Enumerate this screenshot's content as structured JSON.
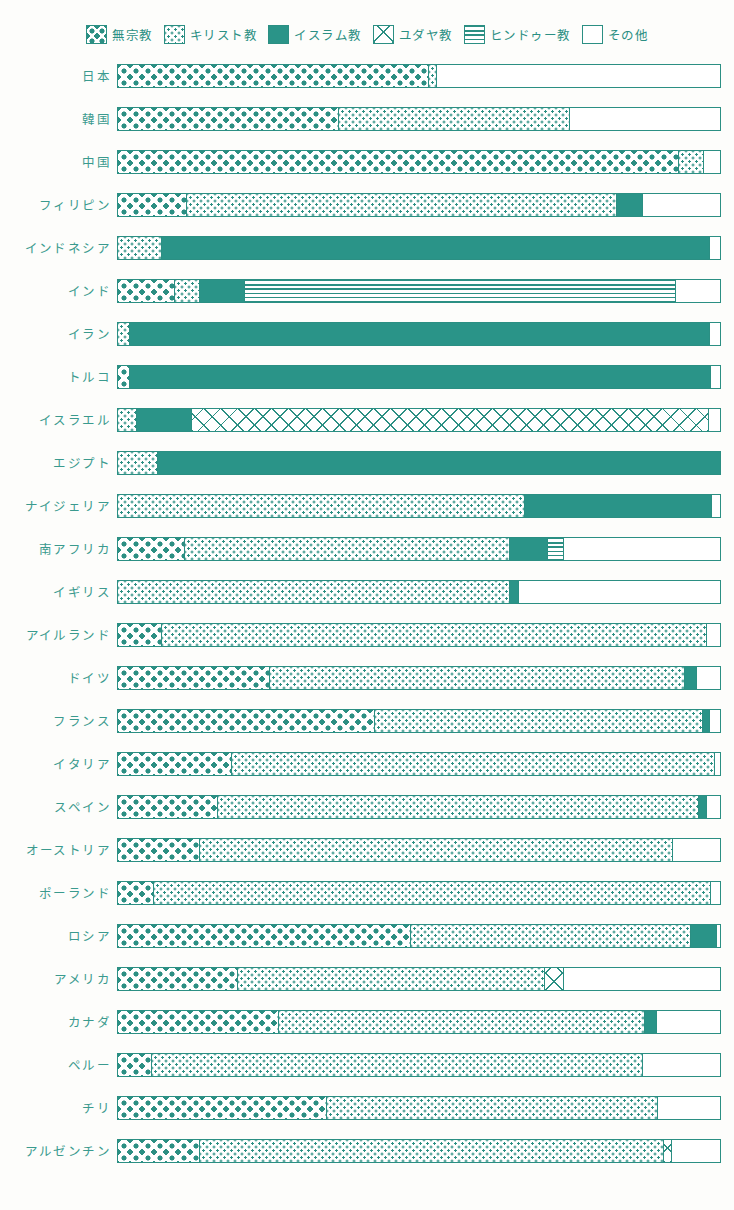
{
  "legend": {
    "items": [
      {
        "key": "none",
        "label": "無宗教",
        "pattern": "p-none",
        "icon": "diamond-grid-swatch"
      },
      {
        "key": "christian",
        "label": "キリスト教",
        "pattern": "p-christian",
        "icon": "dotted-swatch"
      },
      {
        "key": "islam",
        "label": "イスラム教",
        "pattern": "p-islam",
        "icon": "solid-teal-swatch"
      },
      {
        "key": "jewish",
        "label": "ユダヤ教",
        "pattern": "p-jewish",
        "icon": "cross-hatch-swatch"
      },
      {
        "key": "hindu",
        "label": "ヒンドゥー教",
        "pattern": "p-hindu",
        "icon": "horizontal-stripe-swatch"
      },
      {
        "key": "other",
        "label": "その他",
        "pattern": "p-other",
        "icon": "empty-swatch"
      }
    ]
  },
  "colors": {
    "teal": "#2a9488",
    "outline": "#2b8f83",
    "label": "#3a9a8e",
    "background": "#fdfdfb"
  },
  "footnote": "",
  "chart_data": {
    "type": "bar",
    "subtype": "stacked-horizontal-100percent",
    "title": "",
    "xlabel": "",
    "ylabel": "",
    "xlim": [
      0,
      100
    ],
    "grid": false,
    "legend_position": "top-center",
    "series": [
      {
        "name": "無宗教",
        "key": "none"
      },
      {
        "name": "キリスト教",
        "key": "christian"
      },
      {
        "name": "イスラム教",
        "key": "islam"
      },
      {
        "name": "ユダヤ教",
        "key": "jewish"
      },
      {
        "name": "ヒンドゥー教",
        "key": "hindu"
      },
      {
        "name": "その他",
        "key": "other"
      }
    ],
    "categories": [
      "日本",
      "韓国",
      "中国",
      "フィリピン",
      "インドネシア",
      "インド",
      "イラン",
      "トルコ",
      "イスラエル",
      "エジプト",
      "ナイジェリア",
      "南アフリカ",
      "イギリス",
      "アイルランド",
      "ドイツ",
      "フランス",
      "イタリア",
      "スペイン",
      "オーストリア",
      "ポーランド",
      "ロシア",
      "アメリカ",
      "カナダ",
      "ペルー",
      "チリ",
      "アルゼンチン"
    ],
    "rows": [
      {
        "country": "日本",
        "values": {
          "none": 51.5,
          "christian": 1.3,
          "islam": 0,
          "jewish": 0,
          "hindu": 0,
          "other": 47.2
        }
      },
      {
        "country": "韓国",
        "values": {
          "none": 36.5,
          "christian": 38.5,
          "islam": 0,
          "jewish": 0,
          "hindu": 0,
          "other": 25.0
        }
      },
      {
        "country": "中国",
        "values": {
          "none": 93.0,
          "christian": 4.2,
          "islam": 0,
          "jewish": 0,
          "hindu": 0,
          "other": 2.8
        }
      },
      {
        "country": "フィリピン",
        "values": {
          "none": 11.3,
          "christian": 71.4,
          "islam": 4.3,
          "jewish": 0,
          "hindu": 0,
          "other": 13.0
        }
      },
      {
        "country": "インドネシア",
        "values": {
          "none": 0,
          "christian": 7.2,
          "islam": 91.0,
          "jewish": 0,
          "hindu": 0,
          "other": 1.8
        }
      },
      {
        "country": "インド",
        "values": {
          "none": 9.3,
          "christian": 4.2,
          "islam": 7.5,
          "jewish": 0,
          "hindu": 71.5,
          "other": 7.5
        }
      },
      {
        "country": "イラン",
        "values": {
          "none": 0,
          "christian": 1.8,
          "islam": 96.4,
          "jewish": 0,
          "hindu": 0,
          "other": 1.8
        }
      },
      {
        "country": "トルコ",
        "values": {
          "none": 1.8,
          "christian": 0,
          "islam": 96.6,
          "jewish": 0,
          "hindu": 0,
          "other": 1.6
        }
      },
      {
        "country": "イスラエル",
        "values": {
          "none": 0,
          "christian": 3.0,
          "islam": 9.2,
          "jewish": 85.8,
          "hindu": 0,
          "other": 2.0
        }
      },
      {
        "country": "エジプト",
        "values": {
          "none": 0,
          "christian": 6.5,
          "islam": 93.5,
          "jewish": 0,
          "hindu": 0,
          "other": 0
        }
      },
      {
        "country": "ナイジェリア",
        "values": {
          "none": 0,
          "christian": 67.5,
          "islam": 31.0,
          "jewish": 0,
          "hindu": 0,
          "other": 1.5
        }
      },
      {
        "country": "南アフリカ",
        "values": {
          "none": 11.0,
          "christian": 54.0,
          "islam": 6.2,
          "jewish": 0,
          "hindu": 2.8,
          "other": 26.0
        }
      },
      {
        "country": "イギリス",
        "values": {
          "none": 0,
          "christian": 65.0,
          "islam": 1.5,
          "jewish": 0,
          "hindu": 0,
          "other": 33.5
        }
      },
      {
        "country": "アイルランド",
        "values": {
          "none": 7.2,
          "christian": 90.5,
          "islam": 0,
          "jewish": 0,
          "hindu": 0,
          "other": 2.3
        }
      },
      {
        "country": "ドイツ",
        "values": {
          "none": 25.0,
          "christian": 69.0,
          "islam": 2.0,
          "jewish": 0,
          "hindu": 0,
          "other": 4.0
        }
      },
      {
        "country": "フランス",
        "values": {
          "none": 42.5,
          "christian": 54.5,
          "islam": 1.2,
          "jewish": 0,
          "hindu": 0,
          "other": 1.8
        }
      },
      {
        "country": "イタリア",
        "values": {
          "none": 18.8,
          "christian": 80.2,
          "islam": 0,
          "jewish": 0,
          "hindu": 0,
          "other": 1.0
        }
      },
      {
        "country": "スペイン",
        "values": {
          "none": 16.5,
          "christian": 79.8,
          "islam": 1.3,
          "jewish": 0,
          "hindu": 0,
          "other": 2.4
        }
      },
      {
        "country": "オーストリア",
        "values": {
          "none": 13.5,
          "christian": 78.5,
          "islam": 0,
          "jewish": 0,
          "hindu": 0,
          "other": 8.0
        }
      },
      {
        "country": "ポーランド",
        "values": {
          "none": 5.8,
          "christian": 92.5,
          "islam": 0,
          "jewish": 0,
          "hindu": 0,
          "other": 1.7
        }
      },
      {
        "country": "ロシア",
        "values": {
          "none": 48.5,
          "christian": 46.5,
          "islam": 4.3,
          "jewish": 0,
          "hindu": 0,
          "other": 0.7
        }
      },
      {
        "country": "アメリカ",
        "values": {
          "none": 19.8,
          "christian": 51.0,
          "islam": 0,
          "jewish": 3.2,
          "hindu": 0,
          "other": 26.0
        }
      },
      {
        "country": "カナダ",
        "values": {
          "none": 26.5,
          "christian": 60.8,
          "islam": 2.0,
          "jewish": 0,
          "hindu": 0,
          "other": 10.7
        }
      },
      {
        "country": "ペルー",
        "values": {
          "none": 5.5,
          "christian": 81.5,
          "islam": 0,
          "jewish": 0,
          "hindu": 0,
          "other": 13.0
        }
      },
      {
        "country": "チリ",
        "values": {
          "none": 34.5,
          "christian": 55.0,
          "islam": 0,
          "jewish": 0,
          "hindu": 0,
          "other": 10.5
        }
      },
      {
        "country": "アルゼンチン",
        "values": {
          "none": 13.5,
          "christian": 77.0,
          "islam": 0,
          "jewish": 1.3,
          "hindu": 0,
          "other": 8.2
        }
      }
    ]
  }
}
